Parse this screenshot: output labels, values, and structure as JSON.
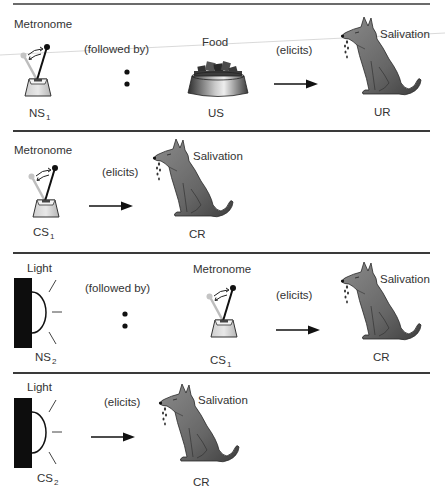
{
  "panels": [
    {
      "id": "panel-1",
      "items": [
        {
          "caption": "Metronome",
          "label": "NS",
          "sub": "1",
          "icon": "metronome-icon"
        },
        {
          "connector": "(followed by)",
          "symbol": ":"
        },
        {
          "caption": "Food",
          "label": "US",
          "icon": "food-bowl-icon"
        },
        {
          "connector": "(elicits)",
          "symbol": "→"
        },
        {
          "caption": "Salivation",
          "label": "UR",
          "icon": "salivating-dog-icon"
        }
      ]
    },
    {
      "id": "panel-2",
      "items": [
        {
          "caption": "Metronome",
          "label": "CS",
          "sub": "1",
          "icon": "metronome-icon"
        },
        {
          "connector": "(elicits)",
          "symbol": "→"
        },
        {
          "caption": "Salivation",
          "label": "CR",
          "icon": "salivating-dog-icon"
        }
      ]
    },
    {
      "id": "panel-3",
      "items": [
        {
          "caption": "Light",
          "label": "NS",
          "sub": "2",
          "icon": "light-icon"
        },
        {
          "connector": "(followed by)",
          "symbol": ":"
        },
        {
          "caption": "Metronome",
          "label": "CS",
          "sub": "1",
          "icon": "metronome-icon"
        },
        {
          "connector": "(elicits)",
          "symbol": "→"
        },
        {
          "caption": "Salivation",
          "label": "CR",
          "icon": "salivating-dog-icon"
        }
      ]
    },
    {
      "id": "panel-4",
      "items": [
        {
          "caption": "Light",
          "label": "CS",
          "sub": "2",
          "icon": "light-icon"
        },
        {
          "connector": "(elicits)",
          "symbol": "→"
        },
        {
          "caption": "Salivation",
          "label": "CR",
          "icon": "salivating-dog-icon"
        }
      ]
    }
  ],
  "colors": {
    "rule": "#3a3a3a",
    "dog": "#6e6e6e",
    "text": "#333333"
  }
}
